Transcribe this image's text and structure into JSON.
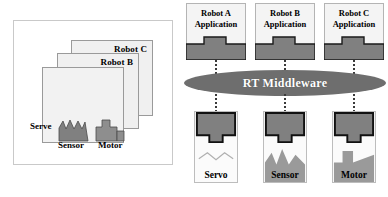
{
  "diagram": {
    "left_panel": {
      "name": "monolithic-stack",
      "cards": [
        {
          "id": "card-c",
          "label": "Robot C"
        },
        {
          "id": "card-b",
          "label": "Robot B"
        },
        {
          "id": "card-a",
          "label": ""
        }
      ],
      "component_labels": {
        "servo": "Serve",
        "sensor": "Sensor",
        "motor": "Motor"
      }
    },
    "right_panel": {
      "name": "middleware-architecture",
      "applications": [
        {
          "line1": "Robot A",
          "line2": "Application"
        },
        {
          "line1": "Robot B",
          "line2": "Application"
        },
        {
          "line1": "Robot C",
          "line2": "Application"
        }
      ],
      "middleware": "RT Middleware",
      "devices": [
        {
          "label": "Servo"
        },
        {
          "label": "Sensor"
        },
        {
          "label": "Motor"
        }
      ]
    }
  },
  "colors": {
    "component_gray": "#808080",
    "glyph_gray": "#848484",
    "middleware_gray": "#6e6e6e",
    "card_fill": "#f0f0f0",
    "border_gray": "#b4b4b4",
    "text_black": "#000000",
    "middleware_text": "#ffffff"
  }
}
